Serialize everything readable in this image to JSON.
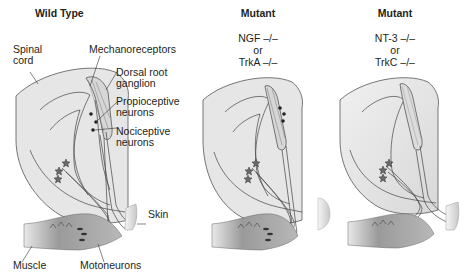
{
  "panels": [
    {
      "title": "Wild Type",
      "genotype_lines": []
    },
    {
      "title": "Mutant",
      "genotype_lines": [
        "NGF –/–",
        "or",
        "TrkA –/–"
      ]
    },
    {
      "title": "Mutant",
      "genotype_lines": [
        "NT-3 –/–",
        "or",
        "TrkC –/–"
      ]
    }
  ],
  "labels": {
    "spinal_cord": [
      "Spinal",
      "cord"
    ],
    "mechanoreceptors": "Mechanoreceptors",
    "dorsal_root_ganglion": [
      "Dorsal root",
      "ganglion"
    ],
    "propioceptive_neurons": [
      "Propioceptive",
      "neurons"
    ],
    "nociceptive_neurons": [
      "Nociceptive",
      "neurons"
    ],
    "skin": "Skin",
    "muscle": "Muscle",
    "motoneurons": "Motoneurons"
  },
  "colors": {
    "spinal_cord_fill": "#e4e4e4",
    "drg_fill": "#d8d8d8",
    "muscle_fill": "#9a9a9a",
    "skin_fill": "#e0e0e0",
    "line": "#3a3a3a",
    "text": "#231f20"
  }
}
